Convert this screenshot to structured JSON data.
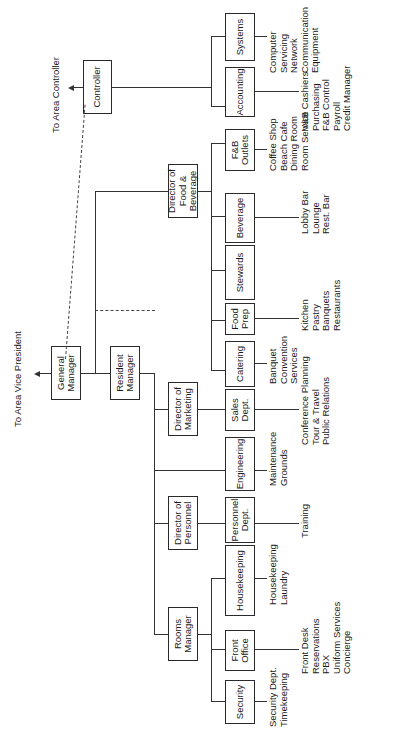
{
  "chart": {
    "top_links": {
      "vice_president": "To Area Vice President",
      "area_controller": "To Area Controller"
    },
    "executive": {
      "general_manager": "General\nManager",
      "controller": "Controller",
      "resident_manager": "Resident\nManager"
    },
    "directors": {
      "food_beverage": "Director of\nFood & Beverage",
      "marketing": "Director of\nMarketing",
      "personnel": "Director of\nPersonnel",
      "rooms": "Rooms\nManager"
    },
    "departments": [
      {
        "name": "Security",
        "functions": "Security Dept.\nTimekeeping"
      },
      {
        "name": "Front\nOffice",
        "functions": "Front Desk\nReservations\nPBX\nUniform Services\nConcierge"
      },
      {
        "name": "Housekeeping",
        "functions": "Housekeeping\nLaundry"
      },
      {
        "name": "Personnel\nDept.",
        "functions": "Training"
      },
      {
        "name": "Engineering",
        "functions": "Maintenance\nGrounds"
      },
      {
        "name": "Sales\nDept.",
        "functions": "Conference Planning\nTour & Travel\nPublic Relations"
      },
      {
        "name": "Catering",
        "functions": "Banquet\nConvention\nServices"
      },
      {
        "name": "Food\nPrep",
        "functions": "Kitchen\nPastry\nBanquets\nRestaurants"
      },
      {
        "name": "Stewards",
        "functions": ""
      },
      {
        "name": "Beverage",
        "functions": "Lobby Bar\nLounge\nRest. Bar"
      },
      {
        "name": "F&B\nOutlets",
        "functions": "Coffee Shop\nBeach Cafe\nDining Room\nRoom Service"
      },
      {
        "name": "Accounting",
        "functions": "V&B Cashiers\nPurchasing\nF&B Control\nPayroll\nCredit Manager"
      },
      {
        "name": "Systems",
        "functions": "Computer Servicing\nNetwork\nCommunication\nEquipment"
      }
    ]
  }
}
